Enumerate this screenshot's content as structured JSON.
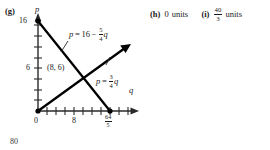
{
  "figure": {
    "part_label": "(g)",
    "axes": {
      "x_label": "q",
      "y_label": "p",
      "origin_label": "0",
      "x_ticks": [
        {
          "value": 8,
          "label": "8"
        },
        {
          "value": 12.8,
          "label_numerator": "64",
          "label_denominator": "5"
        }
      ],
      "y_ticks": [
        {
          "value": 16,
          "label": "16"
        },
        {
          "value": 6,
          "label": "6"
        }
      ]
    },
    "curves": [
      {
        "name": "demand-line",
        "equation_text": "p = 16 - 5/4 q",
        "lhs": "p",
        "operator": "=",
        "intercept": "16",
        "sign": "−",
        "slope_numerator": "5",
        "slope_denominator": "4",
        "variable": "q"
      },
      {
        "name": "supply-line",
        "equation_text": "p = 3/4 q",
        "lhs": "p",
        "operator": "=",
        "slope_numerator": "3",
        "slope_denominator": "4",
        "variable": "q"
      }
    ],
    "intersection_point": {
      "label": "(8, 6)",
      "q": 8,
      "p": 6
    },
    "colors": {
      "ink": "#1a1a1a",
      "axis": "#2a2a2a",
      "curve": "#000000"
    }
  },
  "answers": [
    {
      "part_label": "(h)",
      "value": "0",
      "unit": "units",
      "is_fraction": false
    },
    {
      "part_label": "(i)",
      "numerator": "40",
      "denominator": "3",
      "unit": "units",
      "is_fraction": true
    }
  ],
  "page_number": "80"
}
